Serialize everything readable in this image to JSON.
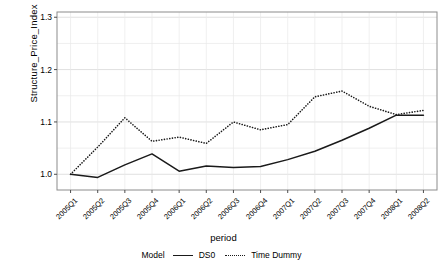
{
  "chart_data": {
    "type": "line",
    "title": "",
    "xlabel": "period",
    "ylabel": "Structure_Price_Index",
    "categories": [
      "2005Q1",
      "2005Q2",
      "2005Q3",
      "2005Q4",
      "2006Q1",
      "2006Q2",
      "2006Q3",
      "2006Q4",
      "2007Q1",
      "2007Q2",
      "2007Q3",
      "2007Q4",
      "2008Q1",
      "2008Q2"
    ],
    "series": [
      {
        "name": "DS0",
        "style": "solid",
        "color": "#1a1a1a",
        "values": [
          1.0,
          0.994,
          1.018,
          1.039,
          1.006,
          1.016,
          1.013,
          1.015,
          1.028,
          1.044,
          1.065,
          1.088,
          1.113,
          1.113
        ]
      },
      {
        "name": "Time Dummy",
        "style": "dotted",
        "color": "#1a1a1a",
        "values": [
          1.0,
          1.052,
          1.108,
          1.063,
          1.071,
          1.059,
          1.1,
          1.085,
          1.095,
          1.148,
          1.159,
          1.13,
          1.114,
          1.122
        ]
      }
    ],
    "ylim": [
      0.97,
      1.31
    ],
    "yticks": [
      1.0,
      1.1,
      1.2,
      1.3
    ],
    "ytick_labels": [
      "1.0",
      "1.1",
      "1.2",
      "1.3"
    ],
    "yminor": [
      1.05,
      1.15,
      1.25
    ],
    "grid": true,
    "legend_position": "bottom",
    "legend_title": "Model"
  },
  "axis": {
    "y_title": "Structure_Price_Index",
    "x_title": "period"
  },
  "legend": {
    "title": "Model",
    "entries": [
      {
        "label": "DS0"
      },
      {
        "label": "Time Dummy"
      }
    ]
  }
}
